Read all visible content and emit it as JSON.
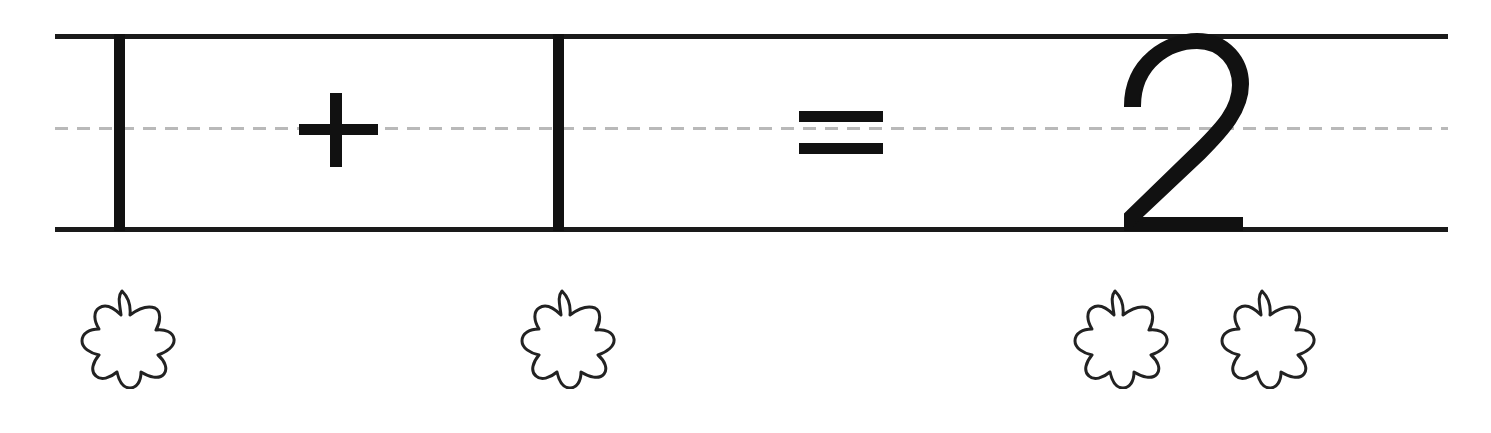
{
  "worksheet": {
    "type": "handwriting-math-practice",
    "width": 1491,
    "height": 433,
    "background_color": "#ffffff",
    "ink_color": "#111111",
    "midline_color": "#b9b9b9"
  },
  "guides": {
    "top_line_label": "top ruled line",
    "midline_label": "dashed midline",
    "bottom_line_label": "baseline",
    "midline_style": "dashed"
  },
  "equation": {
    "full_text": "1 + 1 = 2",
    "first_addend": "1",
    "operator": "+",
    "second_addend": "1",
    "equals": "=",
    "sum": "2",
    "operator_name": "plus-sign",
    "equals_name": "equals-sign"
  },
  "counters": {
    "shape": "flower",
    "petal_count": 8,
    "outline_color": "#222222",
    "fill_color": "#ffffff",
    "total": 4,
    "groups": [
      {
        "group_label": "first addend group",
        "count": 1,
        "count_text": "1"
      },
      {
        "group_label": "second addend group",
        "count": 1,
        "count_text": "1"
      },
      {
        "group_label": "sum group",
        "count": 2,
        "count_text": "2"
      }
    ],
    "items": [
      {
        "label": "flower 1",
        "group": "first addend group"
      },
      {
        "label": "flower 2",
        "group": "second addend group"
      },
      {
        "label": "flower 3",
        "group": "sum group"
      },
      {
        "label": "flower 4",
        "group": "sum group"
      }
    ]
  }
}
